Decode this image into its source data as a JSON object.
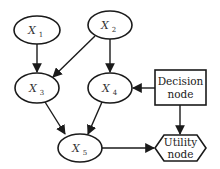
{
  "diagram": {
    "type": "influence-diagram",
    "nodes": [
      {
        "id": "X1",
        "label": "X",
        "subscript": "1",
        "shape": "ellipse"
      },
      {
        "id": "X2",
        "label": "X",
        "subscript": "2",
        "shape": "ellipse"
      },
      {
        "id": "X3",
        "label": "X",
        "subscript": "3",
        "shape": "ellipse"
      },
      {
        "id": "X4",
        "label": "X",
        "subscript": "4",
        "shape": "ellipse"
      },
      {
        "id": "X5",
        "label": "X",
        "subscript": "5",
        "shape": "ellipse"
      },
      {
        "id": "decision",
        "line1": "Decision",
        "line2": "node",
        "shape": "rectangle"
      },
      {
        "id": "utility",
        "line1": "Utility",
        "line2": "node",
        "shape": "hexagon"
      }
    ],
    "edges": [
      {
        "from": "X1",
        "to": "X3"
      },
      {
        "from": "X2",
        "to": "X3"
      },
      {
        "from": "X2",
        "to": "X4"
      },
      {
        "from": "decision",
        "to": "X4"
      },
      {
        "from": "X3",
        "to": "X5"
      },
      {
        "from": "X4",
        "to": "X5"
      },
      {
        "from": "decision",
        "to": "utility"
      },
      {
        "from": "X5",
        "to": "utility"
      }
    ],
    "colors": {
      "stroke": "#1a1a1a",
      "fill": "#ffffff",
      "text": "#333333"
    }
  }
}
